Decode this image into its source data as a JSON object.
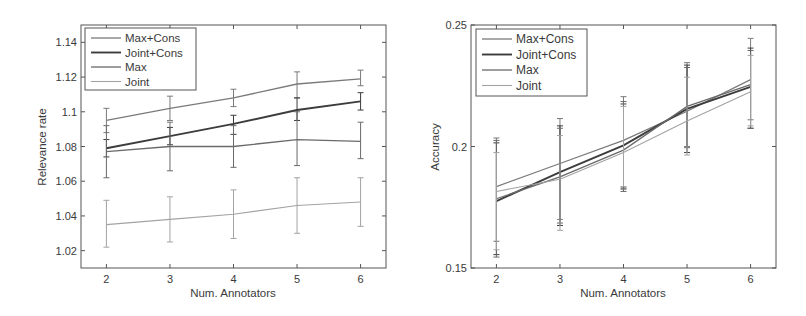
{
  "chart_data": [
    {
      "type": "line",
      "title": "",
      "xlabel": "Num. Annotators",
      "ylabel": "Relevance rate",
      "x": [
        2,
        3,
        4,
        5,
        6
      ],
      "xticks": [
        "2",
        "3",
        "4",
        "5",
        "6"
      ],
      "xlim": [
        1.6,
        6.4
      ],
      "ylim": [
        1.01,
        1.15
      ],
      "yticks": [
        "1.02",
        "1.04",
        "1.06",
        "1.08",
        "1.1",
        "1.12",
        "1.14"
      ],
      "ytick_values": [
        1.02,
        1.04,
        1.06,
        1.08,
        1.1,
        1.12,
        1.14
      ],
      "grid": false,
      "legend_position": "upper left",
      "series": [
        {
          "name": "Max+Cons",
          "values": [
            1.095,
            1.102,
            1.108,
            1.116,
            1.119
          ],
          "err_low": [
            1.088,
            1.095,
            1.103,
            1.108,
            1.115
          ],
          "err_high": [
            1.102,
            1.109,
            1.113,
            1.123,
            1.124
          ],
          "color": "#7a7a7a",
          "width": 1.3
        },
        {
          "name": "Joint+Cons",
          "values": [
            1.079,
            1.086,
            1.093,
            1.101,
            1.106
          ],
          "err_low": [
            1.074,
            1.081,
            1.087,
            1.095,
            1.101
          ],
          "err_high": [
            1.084,
            1.091,
            1.098,
            1.108,
            1.111
          ],
          "color": "#3c3c3c",
          "width": 1.9
        },
        {
          "name": "Max",
          "values": [
            1.077,
            1.08,
            1.08,
            1.084,
            1.083
          ],
          "err_low": [
            1.062,
            1.066,
            1.068,
            1.069,
            1.073
          ],
          "err_high": [
            1.092,
            1.094,
            1.092,
            1.1,
            1.094
          ],
          "color": "#6a6a6a",
          "width": 1.3
        },
        {
          "name": "Joint",
          "values": [
            1.035,
            1.038,
            1.041,
            1.046,
            1.048
          ],
          "err_low": [
            1.022,
            1.025,
            1.027,
            1.03,
            1.034
          ],
          "err_high": [
            1.049,
            1.051,
            1.055,
            1.062,
            1.062
          ],
          "color": "#a3a3a3",
          "width": 1.1
        }
      ]
    },
    {
      "type": "line",
      "title": "",
      "xlabel": "Num. Annotators",
      "ylabel": "Accuracy",
      "x": [
        2,
        3,
        4,
        5,
        6
      ],
      "xticks": [
        "2",
        "3",
        "4",
        "5",
        "6"
      ],
      "xlim": [
        1.6,
        6.4
      ],
      "ylim": [
        0.15,
        0.25
      ],
      "yticks": [
        "0.15",
        "0.2",
        "0.25"
      ],
      "ytick_values": [
        0.15,
        0.2,
        0.25
      ],
      "grid": false,
      "legend_position": "upper left",
      "series": [
        {
          "name": "Max+Cons",
          "values": [
            0.1835,
            0.193,
            0.2025,
            0.2145,
            0.2275
          ],
          "err_low": [
            0.161,
            0.17,
            0.183,
            0.2,
            0.211
          ],
          "err_high": [
            0.2035,
            0.2115,
            0.2205,
            0.2345,
            0.2445
          ],
          "color": "#7a7a7a",
          "width": 1.3
        },
        {
          "name": "Joint+Cons",
          "values": [
            0.1775,
            0.1895,
            0.2005,
            0.2155,
            0.2245
          ],
          "err_low": [
            0.1555,
            0.1675,
            0.1825,
            0.1975,
            0.2075
          ],
          "err_high": [
            0.2015,
            0.2085,
            0.2175,
            0.2335,
            0.2405
          ],
          "color": "#3c3c3c",
          "width": 1.9
        },
        {
          "name": "Max",
          "values": [
            0.1785,
            0.1875,
            0.1985,
            0.2165,
            0.2255
          ],
          "err_low": [
            0.1545,
            0.1685,
            0.1815,
            0.1995,
            0.2075
          ],
          "err_high": [
            0.2025,
            0.2075,
            0.2185,
            0.2325,
            0.2395
          ],
          "color": "#6a6a6a",
          "width": 1.3
        },
        {
          "name": "Joint",
          "values": [
            0.1815,
            0.1865,
            0.1975,
            0.2105,
            0.2225
          ],
          "err_low": [
            0.1575,
            0.1655,
            0.1835,
            0.1965,
            0.2085
          ],
          "err_high": [
            0.1975,
            0.2045,
            0.2165,
            0.2285,
            0.2375
          ],
          "color": "#a3a3a3",
          "width": 1.1
        }
      ]
    }
  ]
}
